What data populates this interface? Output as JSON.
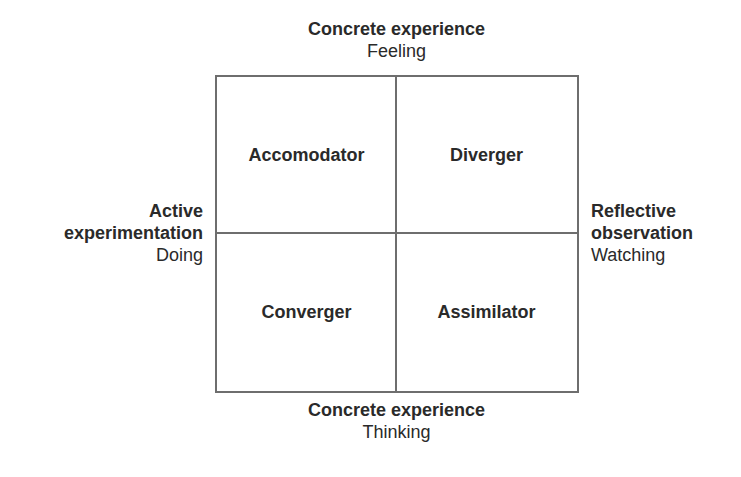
{
  "diagram": {
    "type": "2x2 quadrant",
    "top": {
      "title": "Concrete experience",
      "subtitle": "Feeling"
    },
    "bottom": {
      "title": "Concrete experience",
      "subtitle": "Thinking"
    },
    "left": {
      "title_line1": "Active",
      "title_line2": "experimentation",
      "subtitle": "Doing"
    },
    "right": {
      "title_line1": "Reflective",
      "title_line2": "observation",
      "subtitle": "Watching"
    },
    "quadrants": {
      "top_left": "Accomodator",
      "top_right": "Diverger",
      "bottom_left": "Converger",
      "bottom_right": "Assimilator"
    },
    "colors": {
      "text": "#2a2a2a",
      "lines": "#6e6e6e",
      "background": "#ffffff"
    }
  }
}
